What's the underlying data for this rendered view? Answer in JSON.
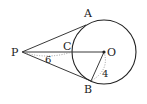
{
  "diagram": {
    "type": "geometry-tangent-lines",
    "points": {
      "P": {
        "label": "P",
        "x": 22,
        "y": 52
      },
      "O": {
        "label": "O",
        "x": 104,
        "y": 52
      },
      "A": {
        "label": "A",
        "x": 86,
        "y": 25
      },
      "B": {
        "label": "B",
        "x": 91,
        "y": 81
      },
      "C": {
        "label": "C",
        "x": 72,
        "y": 52
      }
    },
    "circle": {
      "center": "O",
      "radius": 32
    },
    "measurements": {
      "PC": "6",
      "OB": "4"
    },
    "colors": {
      "stroke": "#222222",
      "dotted": "#888888",
      "background": "#ffffff"
    }
  }
}
